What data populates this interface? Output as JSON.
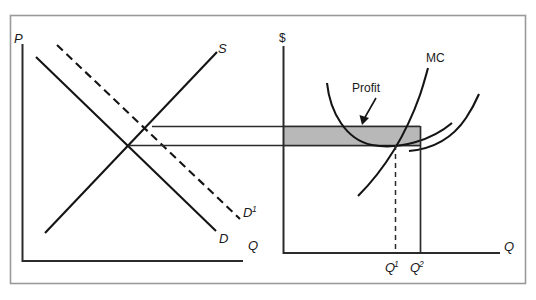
{
  "figure": {
    "frame_color": "#8a8a8a",
    "axis_color": "#2b2b2b",
    "curve_color": "#141414",
    "profit_fill": "#b8b8b8",
    "profit_stroke": "#3a3a3a"
  },
  "left_panel": {
    "name": "market-diagram",
    "y_axis_label": "P",
    "x_axis_label": "Q",
    "curves": [
      {
        "id": "demand",
        "label": "D",
        "style": "solid",
        "desc": "downward sloping demand"
      },
      {
        "id": "demand-shifted",
        "label": "D",
        "superscript": "1",
        "style": "dashed",
        "desc": "demand shifted right"
      },
      {
        "id": "supply",
        "label": "S",
        "style": "solid",
        "desc": "upward sloping supply"
      }
    ],
    "equilibria": [
      {
        "id": "initial",
        "x": 128,
        "y": 145,
        "desc": "S meets D"
      },
      {
        "id": "new",
        "x": 152,
        "y": 127,
        "desc": "S meets D1"
      }
    ]
  },
  "right_panel": {
    "name": "firm-diagram",
    "y_axis_label": "$",
    "x_axis_label": "Q",
    "curves": [
      {
        "id": "marginal-cost",
        "label": "MC",
        "style": "solid"
      },
      {
        "id": "average-total-cost",
        "label": "",
        "style": "solid",
        "desc": "U-shaped average cost curve"
      },
      {
        "id": "second-rising-curve",
        "label": "",
        "style": "solid",
        "desc": "rising curve right of MC"
      }
    ],
    "annotations": [
      {
        "id": "profit",
        "label": "Profit",
        "desc": "arrow pointing to shaded rectangle"
      }
    ],
    "x_ticks": [
      {
        "id": "q1",
        "label": "Q",
        "superscript": "1",
        "x": 395,
        "line": "dashed"
      },
      {
        "id": "q2",
        "label": "Q",
        "superscript": "2",
        "x": 420,
        "line": "solid"
      }
    ],
    "price_lines": [
      {
        "id": "price-new",
        "y": 127,
        "desc": "higher price from shifted demand"
      },
      {
        "id": "price-initial",
        "y": 145,
        "desc": "initial equilibrium price"
      }
    ],
    "shaded_region": {
      "id": "profit-rectangle",
      "x1": 283,
      "x2": 420,
      "y1": 127,
      "y2": 145,
      "fill": "#b8b8b8"
    }
  }
}
